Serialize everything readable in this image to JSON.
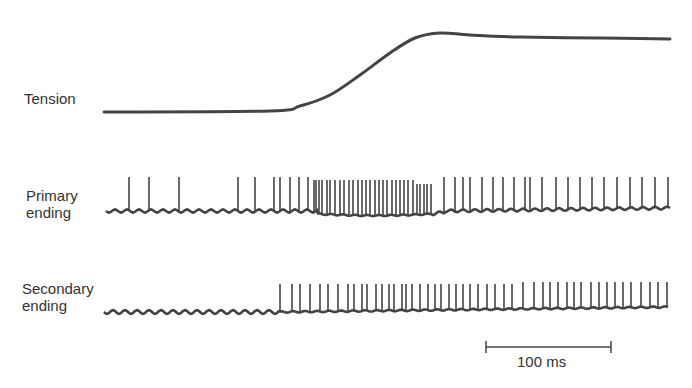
{
  "figure": {
    "traces": [
      {
        "id": "tension",
        "label_lines": [
          "Tension"
        ]
      },
      {
        "id": "primary",
        "label_lines": [
          "Primary",
          "ending"
        ]
      },
      {
        "id": "secondary",
        "label_lines": [
          "Secondary",
          "ending"
        ]
      }
    ],
    "scale_bar": {
      "label": "100 ms"
    },
    "colors": {
      "trace": "#444444",
      "text": "#333333",
      "background": "#ffffff"
    }
  },
  "chart_data": {
    "type": "line",
    "title": "",
    "xlabel": "time",
    "scale_bar": "100 ms",
    "tension": {
      "description": "Flat baseline, sigmoidal rise, small overshoot then plateau",
      "points_px": [
        [
          104,
          112
        ],
        [
          270,
          111
        ],
        [
          300,
          106
        ],
        [
          330,
          95
        ],
        [
          360,
          75
        ],
        [
          390,
          53
        ],
        [
          415,
          38
        ],
        [
          440,
          33
        ],
        [
          470,
          35
        ],
        [
          520,
          37
        ],
        [
          600,
          38
        ],
        [
          670,
          39
        ]
      ]
    },
    "primary_ending_spike_x_px": [
      129,
      149,
      179,
      238,
      255,
      274,
      280,
      290,
      299,
      308,
      314,
      316,
      319,
      322,
      327,
      330,
      335,
      340,
      344,
      349,
      353,
      358,
      362,
      366,
      370,
      375,
      379,
      383,
      387,
      392,
      396,
      400,
      404,
      408,
      413,
      417,
      420,
      424,
      427,
      431,
      444,
      455,
      463,
      470,
      482,
      493,
      503,
      514,
      525,
      530,
      542,
      556,
      568,
      580,
      592,
      604,
      617,
      630,
      642,
      655,
      668
    ],
    "secondary_ending_spike_x_px": [
      280,
      292,
      300,
      310,
      320,
      328,
      338,
      348,
      354,
      362,
      367,
      376,
      382,
      389,
      394,
      402,
      406,
      412,
      420,
      428,
      435,
      441,
      449,
      456,
      463,
      470,
      478,
      487,
      495,
      504,
      512,
      523,
      534,
      543,
      550,
      558,
      567,
      574,
      581,
      591,
      599,
      607,
      615,
      623,
      631,
      641,
      650,
      658,
      667
    ]
  }
}
